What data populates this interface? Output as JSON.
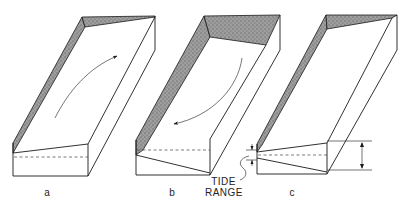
{
  "figure": {
    "type": "schematic block diagrams of tidal channel / basin",
    "panels": [
      {
        "id": "a",
        "label": "a",
        "arrow_direction": "flood (upstream, toward head)"
      },
      {
        "id": "b",
        "label": "b",
        "arrow_direction": "ebb (downstream, toward mouth)"
      },
      {
        "id": "c",
        "label": "c",
        "arrow_direction": "none"
      }
    ],
    "annotations": {
      "tide_range_label_line1": "TIDE",
      "tide_range_label_line2": "RANGE"
    },
    "colors": {
      "line": "#1a1a1a",
      "shading": "#8a8a8a",
      "background": "#ffffff"
    }
  }
}
